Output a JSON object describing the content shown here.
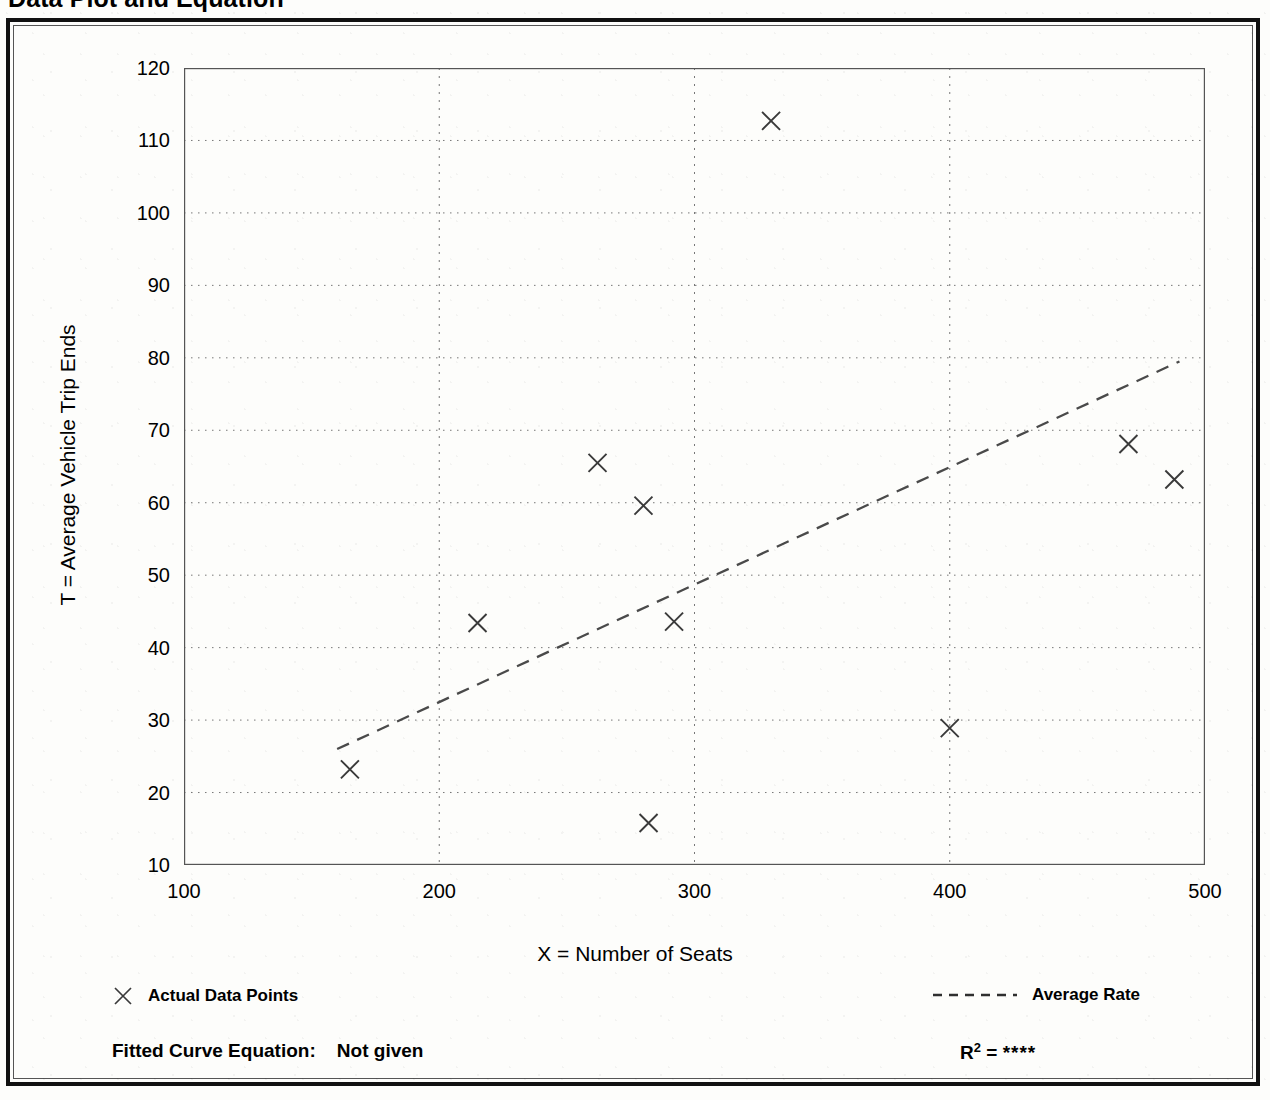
{
  "document": {
    "title": "Data Plot and Equation"
  },
  "axes": {
    "y_label": "T = Average Vehicle Trip Ends",
    "x_label": "X = Number of Seats",
    "y_ticks": [
      "120",
      "110",
      "100",
      "90",
      "80",
      "70",
      "60",
      "50",
      "40",
      "30",
      "20",
      "10"
    ],
    "x_ticks": [
      "100",
      "200",
      "300",
      "400",
      "500"
    ]
  },
  "legend": {
    "data_points_label": "Actual Data Points",
    "data_points_icon": "x-marker-icon",
    "average_rate_label": "Average Rate",
    "average_rate_icon": "dashed-line-icon"
  },
  "footer": {
    "equation_label": "Fitted Curve Equation:",
    "equation_value": "Not given",
    "r_squared_label": "R",
    "r_squared_exponent": "2",
    "r_squared_equals": "=",
    "r_squared_value": "****"
  },
  "colors": {
    "frame": "#111111",
    "axis": "#555555",
    "grid": "#777777",
    "marker": "#3a3a3a",
    "trend": "#4a4a4a",
    "background": "#fdfdfb"
  },
  "chart_data": {
    "type": "scatter",
    "title": "Data Plot and Equation",
    "xlabel": "X = Number of Seats",
    "ylabel": "T = Average Vehicle Trip Ends",
    "xlim": [
      100,
      500
    ],
    "ylim": [
      10,
      120
    ],
    "x_major_step": 100,
    "x_minor_step": 50,
    "y_major_step": 10,
    "y_minor_step": 5,
    "grid": true,
    "grid_style": "dotted",
    "legend_position": "below-axes",
    "series": [
      {
        "name": "Actual Data Points",
        "type": "scatter",
        "marker": "x",
        "points": [
          {
            "x": 165,
            "y": 23.2
          },
          {
            "x": 215,
            "y": 43.4
          },
          {
            "x": 262,
            "y": 65.5
          },
          {
            "x": 280,
            "y": 59.6
          },
          {
            "x": 282,
            "y": 15.8
          },
          {
            "x": 292,
            "y": 43.6
          },
          {
            "x": 330,
            "y": 112.7
          },
          {
            "x": 400,
            "y": 28.9
          },
          {
            "x": 470,
            "y": 68.1
          },
          {
            "x": 488,
            "y": 63.2
          }
        ]
      },
      {
        "name": "Average Rate",
        "type": "line",
        "style": "dashed",
        "points": [
          {
            "x": 160,
            "y": 26.0
          },
          {
            "x": 490,
            "y": 79.5
          }
        ]
      }
    ]
  }
}
